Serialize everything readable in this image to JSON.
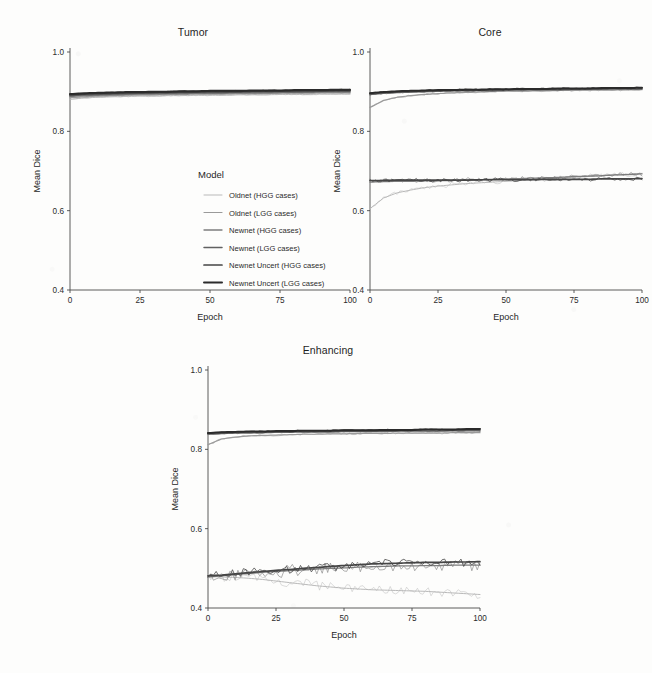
{
  "figure": {
    "background_color": "#fdfdfc",
    "axis_color": "#4a4a4a",
    "y_axis_title": "Mean Dice",
    "x_axis_title": "Epoch"
  },
  "legend": {
    "title": "Model",
    "position": "inside-top-left-panel",
    "entries": [
      {
        "label": "Oldnet (HGG cases)",
        "color": "#b9b9b9",
        "width": 1.0
      },
      {
        "label": "Oldnet (LGG cases)",
        "color": "#9a9a9a",
        "width": 1.2
      },
      {
        "label": "Newnet (HGG cases)",
        "color": "#7d7d7d",
        "width": 1.3
      },
      {
        "label": "Newnet (LGG cases)",
        "color": "#616161",
        "width": 1.5
      },
      {
        "label": "Newnet Uncert (HGG cases)",
        "color": "#454545",
        "width": 1.7
      },
      {
        "label": "Newnet Uncert (LGG cases)",
        "color": "#2b2b2b",
        "width": 2.0
      }
    ]
  },
  "chart_data": [
    {
      "type": "line",
      "title": "Tumor",
      "xlabel": "Epoch",
      "ylabel": "Mean Dice",
      "xlim": [
        0,
        100
      ],
      "ylim": [
        0.4,
        1.0
      ],
      "xticks": [
        0,
        25,
        50,
        75,
        100
      ],
      "yticks": [
        0.4,
        0.6,
        0.8,
        1.0
      ],
      "ytick_labels": [
        "0.4",
        "0.6",
        "0.8",
        "1.0"
      ],
      "grid": false,
      "x": [
        0,
        5,
        10,
        15,
        20,
        25,
        30,
        35,
        40,
        45,
        50,
        55,
        60,
        65,
        70,
        75,
        80,
        85,
        90,
        95,
        100
      ],
      "series": [
        {
          "name": "Oldnet (HGG cases)",
          "color": "#b9b9b9",
          "values": [
            0.881,
            0.884,
            0.886,
            0.887,
            0.888,
            0.889,
            0.889,
            0.89,
            0.89,
            0.891,
            0.891,
            0.891,
            0.892,
            0.892,
            0.892,
            0.893,
            0.893,
            0.893,
            0.894,
            0.894,
            0.894
          ]
        },
        {
          "name": "Oldnet (LGG cases)",
          "color": "#9a9a9a",
          "values": [
            0.885,
            0.887,
            0.889,
            0.89,
            0.891,
            0.892,
            0.892,
            0.893,
            0.893,
            0.894,
            0.894,
            0.894,
            0.895,
            0.895,
            0.895,
            0.896,
            0.896,
            0.896,
            0.897,
            0.897,
            0.897
          ]
        },
        {
          "name": "Newnet (HGG cases)",
          "color": "#7d7d7d",
          "values": [
            0.888,
            0.89,
            0.891,
            0.892,
            0.893,
            0.894,
            0.894,
            0.895,
            0.895,
            0.896,
            0.896,
            0.896,
            0.897,
            0.897,
            0.897,
            0.898,
            0.898,
            0.898,
            0.899,
            0.899,
            0.899
          ]
        },
        {
          "name": "Newnet (LGG cases)",
          "color": "#616161",
          "values": [
            0.89,
            0.892,
            0.893,
            0.894,
            0.895,
            0.896,
            0.896,
            0.897,
            0.897,
            0.898,
            0.898,
            0.898,
            0.899,
            0.899,
            0.899,
            0.9,
            0.9,
            0.9,
            0.901,
            0.901,
            0.901
          ]
        },
        {
          "name": "Newnet Uncert (HGG cases)",
          "color": "#454545",
          "values": [
            0.892,
            0.894,
            0.895,
            0.896,
            0.897,
            0.897,
            0.898,
            0.898,
            0.899,
            0.899,
            0.9,
            0.9,
            0.9,
            0.901,
            0.901,
            0.901,
            0.902,
            0.902,
            0.902,
            0.903,
            0.903
          ]
        },
        {
          "name": "Newnet Uncert (LGG cases)",
          "color": "#2b2b2b",
          "values": [
            0.894,
            0.896,
            0.897,
            0.898,
            0.899,
            0.899,
            0.9,
            0.9,
            0.901,
            0.901,
            0.902,
            0.902,
            0.902,
            0.903,
            0.903,
            0.903,
            0.904,
            0.904,
            0.904,
            0.905,
            0.905
          ]
        }
      ]
    },
    {
      "type": "line",
      "title": "Core",
      "xlabel": "Epoch",
      "ylabel": "Mean Dice",
      "xlim": [
        0,
        100
      ],
      "ylim": [
        0.4,
        1.0
      ],
      "xticks": [
        0,
        25,
        50,
        75,
        100
      ],
      "yticks": [
        0.4,
        0.6,
        0.8,
        1.0
      ],
      "ytick_labels": [
        "0.4",
        "0.6",
        "0.8",
        "1.0"
      ],
      "grid": false,
      "x": [
        0,
        5,
        10,
        15,
        20,
        25,
        30,
        35,
        40,
        45,
        50,
        55,
        60,
        65,
        70,
        75,
        80,
        85,
        90,
        95,
        100
      ],
      "series": [
        {
          "name": "Oldnet (LGG cases)",
          "color": "#9a9a9a",
          "values": [
            0.86,
            0.878,
            0.886,
            0.89,
            0.893,
            0.895,
            0.897,
            0.898,
            0.899,
            0.9,
            0.901,
            0.901,
            0.902,
            0.902,
            0.903,
            0.903,
            0.904,
            0.904,
            0.904,
            0.905,
            0.905
          ]
        },
        {
          "name": "Newnet (LGG cases)",
          "color": "#616161",
          "values": [
            0.893,
            0.896,
            0.898,
            0.899,
            0.9,
            0.901,
            0.902,
            0.902,
            0.903,
            0.903,
            0.904,
            0.904,
            0.905,
            0.905,
            0.905,
            0.906,
            0.906,
            0.906,
            0.907,
            0.907,
            0.907
          ]
        },
        {
          "name": "Newnet Uncert (LGG cases)",
          "color": "#2b2b2b",
          "values": [
            0.896,
            0.899,
            0.901,
            0.902,
            0.903,
            0.904,
            0.904,
            0.905,
            0.905,
            0.906,
            0.906,
            0.907,
            0.907,
            0.907,
            0.908,
            0.908,
            0.908,
            0.909,
            0.909,
            0.909,
            0.91
          ]
        },
        {
          "name": "Oldnet (HGG cases)",
          "color": "#b9b9b9",
          "values": [
            0.605,
            0.632,
            0.645,
            0.652,
            0.658,
            0.662,
            0.665,
            0.668,
            0.67,
            0.672,
            0.674,
            0.676,
            0.678,
            0.68,
            0.682,
            0.684,
            0.686,
            0.688,
            0.69,
            0.692,
            0.694
          ]
        },
        {
          "name": "Newnet (HGG cases)",
          "color": "#7d7d7d",
          "values": [
            0.672,
            0.673,
            0.674,
            0.674,
            0.675,
            0.676,
            0.676,
            0.677,
            0.678,
            0.679,
            0.68,
            0.681,
            0.682,
            0.683,
            0.684,
            0.686,
            0.687,
            0.688,
            0.69,
            0.691,
            0.693
          ]
        },
        {
          "name": "Newnet Uncert (HGG cases)",
          "color": "#454545",
          "values": [
            0.676,
            0.676,
            0.677,
            0.677,
            0.677,
            0.677,
            0.677,
            0.677,
            0.678,
            0.678,
            0.678,
            0.678,
            0.678,
            0.679,
            0.679,
            0.679,
            0.679,
            0.68,
            0.68,
            0.68,
            0.681
          ]
        }
      ]
    },
    {
      "type": "line",
      "title": "Enhancing",
      "xlabel": "Epoch",
      "ylabel": "Mean Dice",
      "xlim": [
        0,
        100
      ],
      "ylim": [
        0.4,
        1.0
      ],
      "xticks": [
        0,
        25,
        50,
        75,
        100
      ],
      "yticks": [
        0.4,
        0.6,
        0.8,
        1.0
      ],
      "ytick_labels": [
        "0.4",
        "0.6",
        "0.8",
        "1.0"
      ],
      "grid": false,
      "x": [
        0,
        5,
        10,
        15,
        20,
        25,
        30,
        35,
        40,
        45,
        50,
        55,
        60,
        65,
        70,
        75,
        80,
        85,
        90,
        95,
        100
      ],
      "series": [
        {
          "name": "Oldnet (LGG cases)",
          "color": "#9a9a9a",
          "values": [
            0.812,
            0.826,
            0.831,
            0.834,
            0.835,
            0.836,
            0.837,
            0.838,
            0.838,
            0.839,
            0.839,
            0.84,
            0.84,
            0.84,
            0.841,
            0.841,
            0.841,
            0.841,
            0.842,
            0.842,
            0.842
          ]
        },
        {
          "name": "Newnet (LGG cases)",
          "color": "#616161",
          "values": [
            0.838,
            0.84,
            0.841,
            0.842,
            0.842,
            0.843,
            0.843,
            0.844,
            0.844,
            0.844,
            0.845,
            0.845,
            0.845,
            0.845,
            0.846,
            0.846,
            0.846,
            0.846,
            0.847,
            0.847,
            0.847
          ]
        },
        {
          "name": "Newnet Uncert (LGG cases)",
          "color": "#2b2b2b",
          "values": [
            0.841,
            0.843,
            0.844,
            0.845,
            0.845,
            0.846,
            0.846,
            0.847,
            0.847,
            0.847,
            0.848,
            0.848,
            0.848,
            0.849,
            0.849,
            0.849,
            0.85,
            0.85,
            0.85,
            0.851,
            0.851
          ]
        },
        {
          "name": "Oldnet (HGG cases)",
          "color": "#b9b9b9",
          "values": [
            0.48,
            0.478,
            0.477,
            0.475,
            0.472,
            0.468,
            0.464,
            0.46,
            0.456,
            0.453,
            0.45,
            0.448,
            0.446,
            0.445,
            0.444,
            0.443,
            0.442,
            0.44,
            0.438,
            0.436,
            0.434
          ]
        },
        {
          "name": "Newnet (HGG cases)",
          "color": "#7d7d7d",
          "values": [
            0.478,
            0.481,
            0.484,
            0.487,
            0.49,
            0.492,
            0.494,
            0.496,
            0.498,
            0.5,
            0.501,
            0.503,
            0.504,
            0.505,
            0.506,
            0.506,
            0.507,
            0.507,
            0.508,
            0.508,
            0.508
          ]
        },
        {
          "name": "Newnet Uncert (HGG cases)",
          "color": "#454545",
          "values": [
            0.481,
            0.483,
            0.486,
            0.489,
            0.492,
            0.495,
            0.497,
            0.5,
            0.502,
            0.505,
            0.507,
            0.509,
            0.511,
            0.512,
            0.513,
            0.514,
            0.515,
            0.515,
            0.516,
            0.516,
            0.517
          ]
        }
      ]
    }
  ]
}
